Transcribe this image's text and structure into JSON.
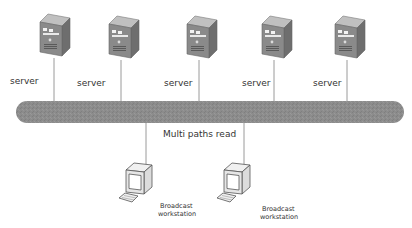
{
  "diagram": {
    "bus_label": "Multi  paths read",
    "colors": {
      "bus": "#8c8c8c",
      "server_front": "#8a8a8a",
      "server_side": "#6e6e6e",
      "server_top": "#b5b5b5",
      "line": "#9a9a9a",
      "monitor": "#e8e8e8",
      "screen": "#d0d0d0"
    },
    "servers": [
      {
        "label": "server"
      },
      {
        "label": "server"
      },
      {
        "label": "server"
      },
      {
        "label": "server"
      },
      {
        "label": "server"
      }
    ],
    "workstations": [
      {
        "label_line1": "Broadcast",
        "label_line2": "workstation"
      },
      {
        "label_line1": "Broadcast",
        "label_line2": "workstation"
      }
    ]
  }
}
